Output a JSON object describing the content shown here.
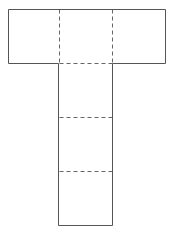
{
  "diagram": {
    "type": "net",
    "stroke_color": "#555555",
    "fold_color": "#666666",
    "squares": [
      {
        "id": "top-left",
        "row": 0,
        "col": 0
      },
      {
        "id": "top-center",
        "row": 0,
        "col": 1
      },
      {
        "id": "top-right",
        "row": 0,
        "col": 2
      },
      {
        "id": "middle-1",
        "row": 1,
        "col": 1
      },
      {
        "id": "middle-2",
        "row": 2,
        "col": 1
      },
      {
        "id": "middle-3",
        "row": 3,
        "col": 1
      }
    ],
    "fold_lines": 5
  }
}
